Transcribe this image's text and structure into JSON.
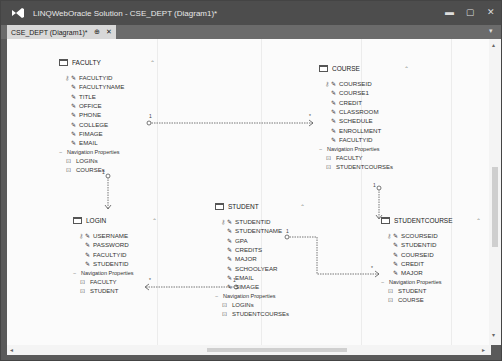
{
  "window": {
    "title": "LINQWebOracle Solution - CSE_DEPT (Diagram1)*",
    "controls": [
      "minimize",
      "maximize",
      "close"
    ]
  },
  "tabs": [
    {
      "label": "CSE_DEPT (Diagram1)*",
      "pin": "⊕",
      "close": "✕",
      "active": true
    }
  ],
  "entities": {
    "faculty": {
      "name": "FACULTY",
      "properties": [
        "FACULTYID",
        "FACULTYNAME",
        "TITLE",
        "OFFICE",
        "PHONE",
        "COLLEGE",
        "FIMAGE",
        "EMAIL"
      ],
      "key": "FACULTYID",
      "nav_header": "Navigation Properties",
      "navigation": [
        "LOGINs",
        "COURSEs"
      ]
    },
    "course": {
      "name": "COURSE",
      "properties": [
        "COURSEID",
        "COURSE1",
        "CREDIT",
        "CLASSROOM",
        "SCHEDULE",
        "ENROLLMENT",
        "FACULTYID"
      ],
      "key": "COURSEID",
      "nav_header": "Navigation Properties",
      "navigation": [
        "FACULTY",
        "STUDENTCOURSEs"
      ]
    },
    "login": {
      "name": "LOGIN",
      "properties": [
        "USERNAME",
        "PASSWORD",
        "FACULTYID",
        "STUDENTID"
      ],
      "key": "USERNAME",
      "nav_header": "Navigation Properties",
      "navigation": [
        "FACULTY",
        "STUDENT"
      ]
    },
    "student": {
      "name": "STUDENT",
      "properties": [
        "STUDENTID",
        "STUDENTNAME",
        "GPA",
        "CREDITS",
        "MAJOR",
        "SCHOOLYEAR",
        "EMAIL",
        "SIMAGE"
      ],
      "key": "STUDENTID",
      "nav_header": "Navigation Properties",
      "navigation": [
        "LOGINs",
        "STUDENTCOURSEs"
      ]
    },
    "studentcourse": {
      "name": "STUDENTCOURSE",
      "properties": [
        "SCOURSEID",
        "STUDENTID",
        "COURSEID",
        "CREDIT",
        "MAJOR"
      ],
      "key": "SCOURSEID",
      "nav_header": "Navigation Properties",
      "navigation": [
        "STUDENT",
        "COURSE"
      ]
    }
  },
  "associations": [
    {
      "from": "FACULTY",
      "to": "COURSE",
      "from_mult": "1",
      "to_mult": "*"
    },
    {
      "from": "FACULTY",
      "to": "LOGIN",
      "from_mult": "1",
      "to_mult": "*"
    },
    {
      "from": "COURSE",
      "to": "STUDENTCOURSE",
      "from_mult": "1",
      "to_mult": "*"
    },
    {
      "from": "STUDENT",
      "to": "LOGIN",
      "from_mult": "1",
      "to_mult": "*"
    },
    {
      "from": "STUDENT",
      "to": "STUDENTCOURSE",
      "from_mult": "1",
      "to_mult": "*"
    }
  ],
  "icons": {
    "key": "⚷",
    "wrench": "✎",
    "nav": "⊡",
    "collapse": "⌃",
    "minus": "−",
    "min": "▬",
    "max": "▢",
    "close": "✕",
    "dropdown": "▾",
    "scroll_left": "◂",
    "scroll_right": "▸",
    "scroll_up": "▴",
    "scroll_down": "▾"
  }
}
